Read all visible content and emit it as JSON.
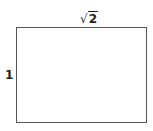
{
  "diagram": {
    "shape": "rectangle",
    "width_label": {
      "radical": "√",
      "value": "2"
    },
    "height_label": "1",
    "stroke_color": "#555555"
  }
}
